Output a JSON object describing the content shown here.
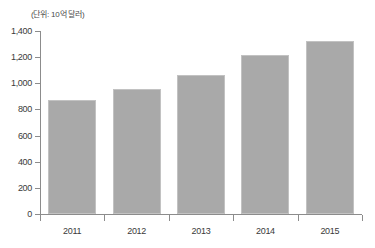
{
  "chart_data": {
    "type": "bar",
    "title": "",
    "subtitle": "",
    "unit_label": "(단위: 10억 달러)",
    "xlabel": "",
    "ylabel": "",
    "categories": [
      "2011",
      "2012",
      "2013",
      "2014",
      "2015"
    ],
    "values": [
      870,
      960,
      1065,
      1215,
      1320
    ],
    "series": [
      {
        "name": "",
        "values": [
          870,
          960,
          1065,
          1215,
          1320
        ]
      }
    ],
    "ylim": [
      0,
      1400
    ],
    "ytick_step": 200,
    "ytick_labels": [
      "0",
      "200",
      "400",
      "600",
      "800",
      "1,000",
      "1,200",
      "1,400"
    ],
    "ytick_values": [
      0,
      200,
      400,
      600,
      800,
      1000,
      1200,
      1400
    ],
    "grid": false,
    "legend": null,
    "legend_position": "none",
    "bar_color": "#a9a9a9",
    "bar_border_color": "#c2c2c2",
    "axis_color": "#8c8c8c",
    "background_color": "#ffffff"
  }
}
